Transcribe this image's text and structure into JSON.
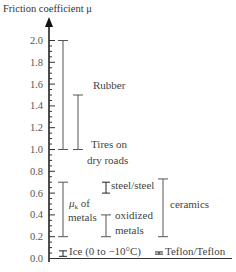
{
  "title": "Friction coefficient μ",
  "chart_data": {
    "type": "range",
    "title": "Friction coefficient μ",
    "ylabel": "Friction coefficient μ",
    "ylim": [
      0.0,
      2.0
    ],
    "yticks": [
      "0.0",
      "0.2",
      "0.4",
      "0.6",
      "0.8",
      "1.0",
      "1.2",
      "1.4",
      "1.6",
      "1.8",
      "2.0"
    ],
    "ranges": [
      {
        "name": "Rubber",
        "min": 1.0,
        "max": 2.0
      },
      {
        "name": "Tires on dry roads",
        "min": 1.0,
        "max": 1.5
      },
      {
        "name": "μk of metals",
        "min": 0.2,
        "max": 0.7
      },
      {
        "name": "steel/steel",
        "min": 0.6,
        "max": 0.7
      },
      {
        "name": "oxidized metals",
        "min": 0.2,
        "max": 0.4
      },
      {
        "name": "ceramics",
        "min": 0.2,
        "max": 0.73
      },
      {
        "name": "Ice (0 to −10°C)",
        "min": 0.02,
        "max": 0.07
      },
      {
        "name": "Teflon/Teflon",
        "min": 0.04,
        "max": 0.06
      }
    ]
  },
  "labels": {
    "rubber": "Rubber",
    "tires_1": "Tires on",
    "tires_2": "dry roads",
    "metals_mu": "μ",
    "metals_sub": "k",
    "metals_of": " of",
    "metals_2": "metals",
    "steel": "steel/steel",
    "oxidized_1": "oxidized",
    "oxidized_2": "metals",
    "ceramics": "ceramics",
    "ice": "Ice (0 to −10°C)",
    "teflon": "Teflon/Teflon"
  }
}
